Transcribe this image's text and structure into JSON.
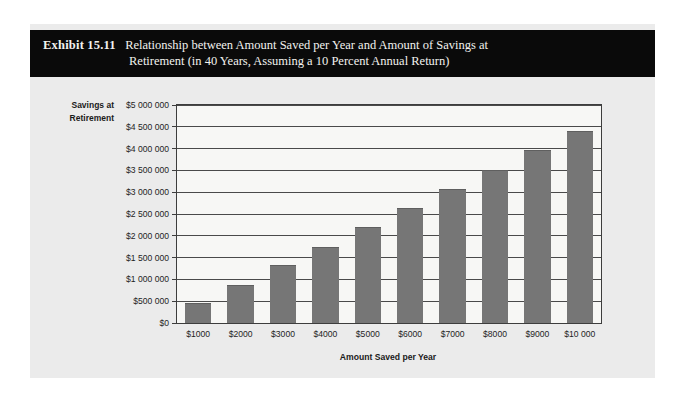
{
  "exhibit": {
    "label": "Exhibit 15.11",
    "title_line1": "Relationship between Amount Saved per Year and Amount of Savings at",
    "title_line2": "Retirement (in 40 Years, Assuming a 10 Percent Annual Return)"
  },
  "colors": {
    "banner_background": "#0a0a0a",
    "banner_text": "#f2f2ef",
    "card_background": "#ebebeb",
    "plot_background": "#f7f7f5",
    "bar_fill": "#767676",
    "axis_line": "#3d3d3d",
    "gridline": "#4a4a4a"
  },
  "chart_data": {
    "type": "bar",
    "title": "Relationship between Amount Saved per Year and Amount of Savings at Retirement (in 40 Years, Assuming a 10 Percent Annual Return)",
    "xlabel": "Amount Saved per Year",
    "ylabel": "Savings at Retirement",
    "ylabel_line1": "Savings at",
    "ylabel_line2": "Retirement",
    "categories": [
      "$1000",
      "$2000",
      "$3000",
      "$4000",
      "$5000",
      "$6000",
      "$7000",
      "$8000",
      "$9000",
      "$10 000"
    ],
    "values": [
      450000,
      880000,
      1320000,
      1750000,
      2200000,
      2640000,
      3080000,
      3500000,
      3960000,
      4400000
    ],
    "value_labels": [
      "$450 000",
      "$880 000",
      "$1 320 000",
      "$1 750 000",
      "$2 200 000",
      "$2 640 000",
      "$3 080 000",
      "$3 500 000",
      "$3 960 000",
      "$4 400 000"
    ],
    "ylim": [
      0,
      5000000
    ],
    "ytick_values": [
      0,
      500000,
      1000000,
      1500000,
      2000000,
      2500000,
      3000000,
      3500000,
      4000000,
      4500000,
      5000000
    ],
    "ytick_labels": [
      "$0",
      "$500 000",
      "$1 000 000",
      "$1 500 000",
      "$2 000 000",
      "$2 500 000",
      "$3 000 000",
      "$3 500 000",
      "$4 000 000",
      "$4 500 000",
      "$5 000 000"
    ],
    "grid": true,
    "grid_axis": "y",
    "legend": false,
    "legend_position": "none"
  }
}
